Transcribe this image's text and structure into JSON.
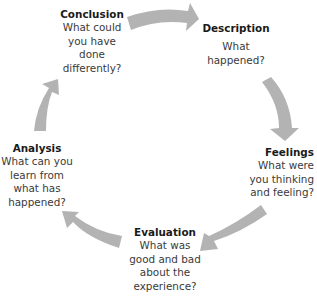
{
  "diagram": {
    "type": "cycle",
    "arrow_color": "#b3b3b3",
    "nodes": [
      {
        "id": "conclusion",
        "title": "Conclusion",
        "lines": [
          "What could",
          "you have",
          "done",
          "differently?"
        ]
      },
      {
        "id": "description",
        "title": "Description",
        "lines": [
          "What",
          "happened?"
        ]
      },
      {
        "id": "feelings",
        "title": "Feelings",
        "lines": [
          "What were",
          "you thinking",
          "and feeling?"
        ]
      },
      {
        "id": "evaluation",
        "title": "Evaluation",
        "lines": [
          "What was",
          "good and bad",
          "about the",
          "experience?"
        ]
      },
      {
        "id": "analysis",
        "title": "Analysis",
        "lines": [
          "What can you",
          "learn from",
          "what has",
          "happened?"
        ]
      }
    ],
    "edges": [
      {
        "from": "conclusion",
        "to": "description"
      },
      {
        "from": "description",
        "to": "feelings"
      },
      {
        "from": "feelings",
        "to": "evaluation"
      },
      {
        "from": "evaluation",
        "to": "analysis"
      },
      {
        "from": "analysis",
        "to": "conclusion"
      }
    ]
  }
}
